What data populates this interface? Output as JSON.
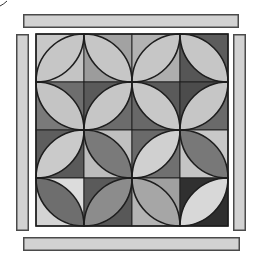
{
  "title": "Orange Peel quilt block with border strips",
  "colors": {
    "background": "#ffffff",
    "outline": "#1e1e1e",
    "strip_fill": "#d2d2d2",
    "strip_stroke": "#4a4a4a"
  },
  "strips": [
    {
      "id": "top-border-strip",
      "x": 23,
      "y": 14,
      "w": 216,
      "h": 14
    },
    {
      "id": "left-border-strip",
      "x": 16,
      "y": 34,
      "w": 13,
      "h": 197
    },
    {
      "id": "right-border-strip",
      "x": 233,
      "y": 34,
      "w": 13,
      "h": 197
    },
    {
      "id": "bottom-border-strip",
      "x": 23,
      "y": 237,
      "w": 217,
      "h": 14
    }
  ],
  "block": {
    "x": 36,
    "y": 34,
    "cell": 48,
    "rows": 4,
    "cols": 4,
    "cells": [
      [
        {
          "lens": "bl-tr",
          "lens_fill": "#c6c6c6",
          "a_fill": "#c8c8c8",
          "b_fill": "#c4c4c4"
        },
        {
          "lens": "tl-br",
          "lens_fill": "#c6c6c6",
          "a_fill": "#a2a2a2",
          "b_fill": "#9c9c9c"
        },
        {
          "lens": "bl-tr",
          "lens_fill": "#c6c6c6",
          "a_fill": "#b2b2b2",
          "b_fill": "#aeaeae"
        },
        {
          "lens": "tl-br",
          "lens_fill": "#c6c6c6",
          "a_fill": "#5c5c5c",
          "b_fill": "#565656"
        }
      ],
      [
        {
          "lens": "tl-br",
          "lens_fill": "#c4c4c4",
          "a_fill": "#6e6e6e",
          "b_fill": "#7a7a7a"
        },
        {
          "lens": "bl-tr",
          "lens_fill": "#c6c6c6",
          "a_fill": "#5a5a5a",
          "b_fill": "#6c6c6c"
        },
        {
          "lens": "tl-br",
          "lens_fill": "#c8c8c8",
          "a_fill": "#5a5a5a",
          "b_fill": "#686868"
        },
        {
          "lens": "bl-tr",
          "lens_fill": "#c6c6c6",
          "a_fill": "#4c4c4c",
          "b_fill": "#6a6a6a"
        }
      ],
      [
        {
          "lens": "bl-tr",
          "lens_fill": "#cacaca",
          "a_fill": "#5e5e5e",
          "b_fill": "#5a5a5a"
        },
        {
          "lens": "tl-br",
          "lens_fill": "#7a7a7a",
          "a_fill": "#c0c0c0",
          "b_fill": "#bcbcbc"
        },
        {
          "lens": "bl-tr",
          "lens_fill": "#d0d0d0",
          "a_fill": "#6a6a6a",
          "b_fill": "#707070"
        },
        {
          "lens": "tl-br",
          "lens_fill": "#787878",
          "a_fill": "#c8c8c8",
          "b_fill": "#c4c4c4"
        }
      ],
      [
        {
          "lens": "tl-br",
          "lens_fill": "#6e6e6e",
          "a_fill": "#dcdcdc",
          "b_fill": "#d4d4d4"
        },
        {
          "lens": "bl-tr",
          "lens_fill": "#8c8c8c",
          "a_fill": "#5a5a5a",
          "b_fill": "#585858"
        },
        {
          "lens": "tl-br",
          "lens_fill": "#a6a6a6",
          "a_fill": "#a0a0a0",
          "b_fill": "#b4b4b4"
        },
        {
          "lens": "bl-tr",
          "lens_fill": "#d8d8d8",
          "a_fill": "#303030",
          "b_fill": "#2e2e2e"
        }
      ]
    ]
  },
  "artifact": {
    "path": "M0 6 Q4 4 7 1"
  }
}
